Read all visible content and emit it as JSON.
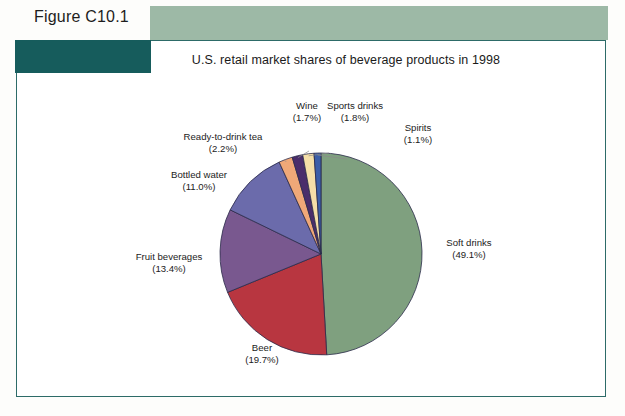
{
  "figure": {
    "label": "Figure C10.1"
  },
  "chart_panel": {
    "title": "U.S. retail market shares of beverage products in 1998"
  },
  "colors": {
    "sage_band": "#9db9a6",
    "teal_block": "#165c5c",
    "frame_border": "#2d6b68",
    "page_background": "#ffffff"
  },
  "chart_data": {
    "type": "pie",
    "title": "U.S. retail market shares of beverage products in 1998",
    "unit": "percent",
    "start_angle_deg": 0,
    "direction": "clockwise",
    "legend": "none",
    "labels_position": "outside-with-leader-lines",
    "categories": [
      "Soft drinks",
      "Beer",
      "Fruit beverages",
      "Bottled water",
      "Ready-to-drink tea",
      "Wine",
      "Sports drinks",
      "Spirits"
    ],
    "values": [
      49.1,
      19.7,
      13.4,
      11.0,
      2.2,
      1.7,
      1.8,
      1.1
    ],
    "value_labels": [
      "(49.1%)",
      "(19.7%)",
      "(13.4%)",
      "(11.0%)",
      "(2.2%)",
      "(1.7%)",
      "(1.8%)",
      "(1.1%)"
    ],
    "slice_colors": [
      "#7fa07f",
      "#b83640",
      "#79588f",
      "#6b6bab",
      "#f0a878",
      "#4a2d6b",
      "#f5dfa8",
      "#3b5ea8"
    ],
    "slices": [
      {
        "name": "Soft drinks",
        "value": 49.1,
        "label": "Soft drinks",
        "value_label": "(49.1%)",
        "color": "#7fa07f"
      },
      {
        "name": "Beer",
        "value": 19.7,
        "label": "Beer",
        "value_label": "(19.7%)",
        "color": "#b83640"
      },
      {
        "name": "Fruit beverages",
        "value": 13.4,
        "label": "Fruit beverages",
        "value_label": "(13.4%)",
        "color": "#79588f"
      },
      {
        "name": "Bottled water",
        "value": 11.0,
        "label": "Bottled water",
        "value_label": "(11.0%)",
        "color": "#6b6bab"
      },
      {
        "name": "Ready-to-drink tea",
        "value": 2.2,
        "label": "Ready-to-drink tea",
        "value_label": "(2.2%)",
        "color": "#f0a878"
      },
      {
        "name": "Wine",
        "value": 1.7,
        "label": "Wine",
        "value_label": "(1.7%)",
        "color": "#4a2d6b"
      },
      {
        "name": "Sports drinks",
        "value": 1.8,
        "label": "Sports drinks",
        "value_label": "(1.8%)",
        "color": "#f5dfa8"
      },
      {
        "name": "Spirits",
        "value": 1.1,
        "label": "Spirits",
        "value_label": "(1.1%)",
        "color": "#3b5ea8"
      }
    ]
  }
}
